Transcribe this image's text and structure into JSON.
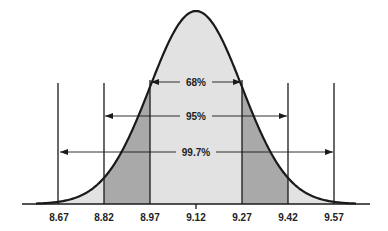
{
  "chart_data": {
    "type": "area",
    "title": "",
    "xlabel": "",
    "ylabel": "",
    "mean": 9.12,
    "std_dev": 0.15,
    "x_ticks": [
      "8.67",
      "8.82",
      "8.97",
      "9.12",
      "9.27",
      "9.42",
      "9.57"
    ],
    "x_tick_values": [
      8.67,
      8.82,
      8.97,
      9.12,
      9.27,
      9.42,
      9.57
    ],
    "xlim": [
      8.55,
      9.69
    ],
    "grid": false,
    "legend": null,
    "regions": [
      {
        "name": "within 1 sd",
        "from": 8.97,
        "to": 9.27,
        "shade": "light",
        "color": "#e2e2e2"
      },
      {
        "name": "1-2 sd",
        "from": 8.82,
        "to": 8.97,
        "shade": "dark",
        "color": "#a9a9a9"
      },
      {
        "name": "1-2 sd",
        "from": 9.27,
        "to": 9.42,
        "shade": "dark",
        "color": "#a9a9a9"
      },
      {
        "name": "tails",
        "from": 8.55,
        "to": 8.82,
        "shade": "light",
        "color": "#e2e2e2"
      },
      {
        "name": "tails",
        "from": 9.42,
        "to": 9.69,
        "shade": "light",
        "color": "#e2e2e2"
      }
    ],
    "annotations": [
      {
        "label": "68%",
        "from": 8.97,
        "to": 9.27,
        "kind": "double-arrow"
      },
      {
        "label": "95%",
        "from": 8.82,
        "to": 9.42,
        "kind": "double-arrow"
      },
      {
        "label": "99.7%",
        "from": 8.67,
        "to": 9.57,
        "kind": "double-arrow"
      }
    ]
  },
  "labels": {
    "ticks": [
      "8.67",
      "8.82",
      "8.97",
      "9.12",
      "9.27",
      "9.42",
      "9.57"
    ],
    "pct_68": "68%",
    "pct_95": "95%",
    "pct_997": "99.7%"
  },
  "colors": {
    "light_fill": "#e2e2e2",
    "dark_fill": "#a9a9a9",
    "line": "#1a1a1a",
    "background": "#ffffff"
  }
}
